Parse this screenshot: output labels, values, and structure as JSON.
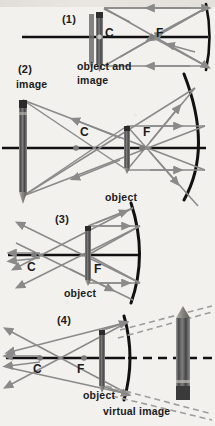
{
  "figure": {
    "title_visible": false,
    "colors": {
      "background": "#f3f1ee",
      "ray": "#8a8a8a",
      "axis": "#111111",
      "mirror": "#111111",
      "dashed_ray": "#9a9a9a",
      "pencil_body": "#5a5a5a",
      "label_text": "#1b1b1b"
    },
    "panels": [
      {
        "id": "panel-1",
        "number": "(1)",
        "number_pos": {
          "x": 62,
          "y": 14
        },
        "labels": [
          {
            "name": "center-label-c",
            "text": "C",
            "x": 105,
            "y": 33
          },
          {
            "name": "focus-label-f",
            "text": "F",
            "x": 156,
            "y": 33
          },
          {
            "name": "caption-object-and",
            "text": "object and",
            "x": 77,
            "y": 63
          },
          {
            "name": "caption-image",
            "text": "image",
            "x": 77,
            "y": 76
          }
        ],
        "object_description": "pencil at center of curvature, object and image coincide",
        "mirror_type": "concave"
      },
      {
        "id": "panel-2",
        "number": "(2)",
        "number_pos": {
          "x": 18,
          "y": 66
        },
        "labels": [
          {
            "name": "caption-image",
            "text": "image",
            "x": 16,
            "y": 80
          },
          {
            "name": "center-label-c",
            "text": "C",
            "x": 80,
            "y": 128
          },
          {
            "name": "focus-label-f",
            "text": "F",
            "x": 143,
            "y": 128
          },
          {
            "name": "caption-object",
            "text": "object",
            "x": 105,
            "y": 196
          }
        ],
        "object_description": "pencil between C and F, image is real, inverted, enlarged",
        "mirror_type": "concave"
      },
      {
        "id": "panel-3",
        "number": "(3)",
        "number_pos": {
          "x": 55,
          "y": 216
        },
        "labels": [
          {
            "name": "center-label-c",
            "text": "C",
            "x": 27,
            "y": 264
          },
          {
            "name": "focus-label-f",
            "text": "F",
            "x": 94,
            "y": 266
          },
          {
            "name": "caption-object",
            "text": "object",
            "x": 64,
            "y": 292
          }
        ],
        "object_description": "pencil at focal point, reflected rays emerge parallel, no image",
        "mirror_type": "concave"
      },
      {
        "id": "panel-4",
        "number": "(4)",
        "number_pos": {
          "x": 57,
          "y": 317
        },
        "labels": [
          {
            "name": "center-label-c",
            "text": "C",
            "x": 33,
            "y": 366
          },
          {
            "name": "focus-label-f",
            "text": "F",
            "x": 77,
            "y": 366
          },
          {
            "name": "caption-object",
            "text": "object",
            "x": 83,
            "y": 393
          },
          {
            "name": "caption-virtual-image",
            "text": "virtual image",
            "x": 103,
            "y": 409
          }
        ],
        "object_description": "pencil inside the focal point, image is virtual, erect, enlarged, behind mirror",
        "mirror_type": "concave"
      }
    ]
  }
}
